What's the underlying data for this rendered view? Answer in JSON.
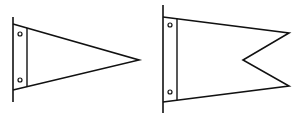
{
  "figure": {
    "stroke_color": "#111111",
    "background": "#ffffff",
    "flags": [
      {
        "name": "pennant",
        "shape": "triangular",
        "pole": {
          "x": 13,
          "y1": 17,
          "y2": 102
        },
        "top_y": 24,
        "bottom_y": 90,
        "strip_x": 27,
        "tip": {
          "x": 139,
          "y": 60
        },
        "holes": [
          {
            "x": 20,
            "y": 34
          },
          {
            "x": 20,
            "y": 80
          }
        ]
      },
      {
        "name": "burgee",
        "shape": "swallowtail",
        "pole": {
          "x": 163,
          "y1": 5,
          "y2": 113
        },
        "top_y": 17,
        "bottom_y": 102,
        "strip_x": 177,
        "upper_tip": {
          "x": 289,
          "y": 33
        },
        "notch": {
          "x": 243,
          "y": 60
        },
        "lower_tip": {
          "x": 289,
          "y": 86
        },
        "holes": [
          {
            "x": 170,
            "y": 25
          },
          {
            "x": 170,
            "y": 92
          }
        ]
      }
    ]
  }
}
